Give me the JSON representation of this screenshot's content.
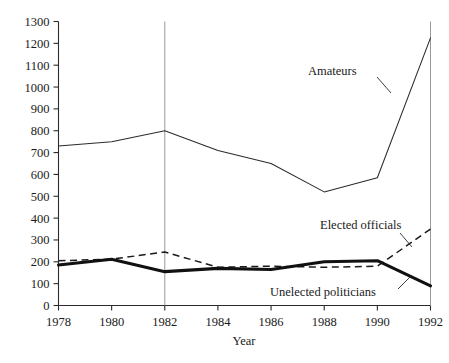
{
  "chart_data": {
    "type": "line",
    "title": "",
    "xlabel": "Year",
    "ylabel": "",
    "x": [
      1978,
      1979,
      1980,
      1981,
      1982,
      1983,
      1984,
      1985,
      1986,
      1987,
      1988,
      1989,
      1990,
      1991,
      1992
    ],
    "xlim": [
      1978,
      1992
    ],
    "ylim": [
      0,
      1300
    ],
    "grid": false,
    "legend_position": "inline-annotations",
    "xticks": [
      "1978",
      "1980",
      "1982",
      "1984",
      "1986",
      "1988",
      "1990",
      "1992"
    ],
    "xtick_values": [
      1978,
      1980,
      1982,
      1984,
      1986,
      1988,
      1990,
      1992
    ],
    "yticks": [
      "0",
      "100",
      "200",
      "300",
      "400",
      "500",
      "600",
      "700",
      "800",
      "900",
      "1000",
      "1100",
      "1200",
      "1300"
    ],
    "ytick_values": [
      0,
      100,
      200,
      300,
      400,
      500,
      600,
      700,
      800,
      900,
      1000,
      1100,
      1200,
      1300
    ],
    "reference_lines": [
      {
        "name": "vertical-1982",
        "x": 1982
      },
      {
        "name": "vertical-1992",
        "x": 1992
      }
    ],
    "series": [
      {
        "name": "Amateurs",
        "style": "thin-solid",
        "color": "#2b2b2b",
        "x": [
          1978,
          1980,
          1982,
          1984,
          1986,
          1988,
          1990,
          1992
        ],
        "values": [
          730,
          750,
          800,
          710,
          650,
          520,
          585,
          1225
        ]
      },
      {
        "name": "Elected officials",
        "style": "dashed",
        "color": "#1a1a1a",
        "x": [
          1978,
          1980,
          1982,
          1984,
          1986,
          1988,
          1990,
          1992
        ],
        "values": [
          205,
          212,
          245,
          175,
          180,
          175,
          180,
          350
        ]
      },
      {
        "name": "Unelected politicians",
        "style": "thick-solid",
        "color": "#111111",
        "x": [
          1978,
          1980,
          1982,
          1984,
          1986,
          1988,
          1990,
          1992
        ],
        "values": [
          185,
          212,
          155,
          170,
          165,
          200,
          205,
          90
        ]
      }
    ],
    "annotations": [
      {
        "name": "amateurs-label",
        "text": "Amateurs",
        "x": 1989.0,
        "y": 1060
      },
      {
        "name": "elected-officials-label",
        "text": "Elected officials",
        "x": 1990.2,
        "y": 400
      },
      {
        "name": "unelected-politicians-label",
        "text": "Unelected politicians",
        "x": 1990.1,
        "y": 55
      }
    ]
  },
  "axes": {
    "x_axis_title": "Year",
    "y_axis_title": ""
  }
}
